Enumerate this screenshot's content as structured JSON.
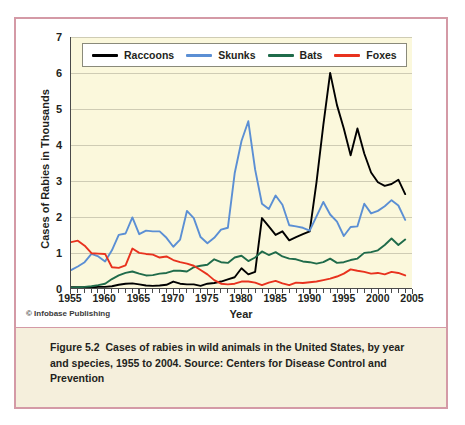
{
  "figure": {
    "credit": "© Infobase Publishing",
    "caption_label": "Figure 5.2",
    "caption_body": "Cases of rabies in wild animals in the United States, by year and species, 1955 to 2004. Source: Centers for Disease Control and Prevention"
  },
  "chart_data": {
    "type": "line",
    "title": "",
    "xlabel": "Year",
    "ylabel": "Cases of Rabies in Thousands",
    "xlim": [
      1955,
      2005
    ],
    "ylim": [
      0,
      7
    ],
    "xticks": [
      1955,
      1960,
      1965,
      1970,
      1975,
      1980,
      1985,
      1990,
      1995,
      2000,
      2005
    ],
    "yticks": [
      0,
      1,
      2,
      3,
      4,
      5,
      6,
      7
    ],
    "xtick_labels": [
      "1955",
      "1960",
      "1965",
      "1970",
      "1975",
      "1980",
      "1985",
      "1990",
      "1995",
      "2000",
      "2005"
    ],
    "ytick_labels": [
      "0",
      "1",
      "2",
      "3",
      "4",
      "5",
      "6",
      "7"
    ],
    "minor_xtick_interval": 1,
    "grid": "horizontal",
    "legend_position": "top-left",
    "x": [
      1955,
      1956,
      1957,
      1958,
      1959,
      1960,
      1961,
      1962,
      1963,
      1964,
      1965,
      1966,
      1967,
      1968,
      1969,
      1970,
      1971,
      1972,
      1973,
      1974,
      1975,
      1976,
      1977,
      1978,
      1979,
      1980,
      1981,
      1982,
      1983,
      1984,
      1985,
      1986,
      1987,
      1988,
      1989,
      1990,
      1991,
      1992,
      1993,
      1994,
      1995,
      1996,
      1997,
      1998,
      1999,
      2000,
      2001,
      2002,
      2003,
      2004
    ],
    "series": [
      {
        "name": "Raccoons",
        "color": "#000000",
        "values": [
          0.02,
          0.02,
          0.02,
          0.02,
          0.03,
          0.03,
          0.05,
          0.09,
          0.12,
          0.13,
          0.1,
          0.07,
          0.06,
          0.07,
          0.09,
          0.18,
          0.12,
          0.1,
          0.1,
          0.06,
          0.12,
          0.14,
          0.18,
          0.24,
          0.3,
          0.55,
          0.38,
          0.45,
          1.95,
          1.72,
          1.48,
          1.58,
          1.33,
          1.42,
          1.5,
          1.58,
          2.95,
          4.55,
          6.0,
          5.1,
          4.45,
          3.7,
          4.45,
          3.75,
          3.22,
          2.95,
          2.85,
          2.9,
          3.02,
          2.62
        ]
      },
      {
        "name": "Skunks",
        "color": "#5b8fd4",
        "values": [
          0.5,
          0.6,
          0.72,
          0.95,
          0.88,
          0.74,
          1.05,
          1.48,
          1.52,
          1.97,
          1.5,
          1.6,
          1.58,
          1.58,
          1.4,
          1.15,
          1.35,
          2.15,
          1.95,
          1.42,
          1.25,
          1.4,
          1.63,
          1.68,
          3.2,
          4.1,
          4.65,
          3.3,
          2.35,
          2.2,
          2.58,
          2.32,
          1.75,
          1.72,
          1.68,
          1.6,
          2.0,
          2.4,
          2.05,
          1.85,
          1.45,
          1.7,
          1.72,
          2.35,
          2.08,
          2.15,
          2.28,
          2.45,
          2.3,
          1.9
        ]
      },
      {
        "name": "Bats",
        "color": "#1f6b4a",
        "values": [
          0.01,
          0.02,
          0.03,
          0.05,
          0.08,
          0.12,
          0.25,
          0.35,
          0.42,
          0.46,
          0.4,
          0.35,
          0.36,
          0.4,
          0.42,
          0.48,
          0.48,
          0.46,
          0.58,
          0.62,
          0.65,
          0.8,
          0.72,
          0.7,
          0.85,
          0.9,
          0.75,
          0.85,
          1.02,
          0.92,
          1.0,
          0.88,
          0.82,
          0.8,
          0.74,
          0.72,
          0.68,
          0.72,
          0.82,
          0.7,
          0.72,
          0.78,
          0.82,
          0.98,
          1.0,
          1.05,
          1.2,
          1.38,
          1.2,
          1.35
        ]
      },
      {
        "name": "Foxes",
        "color": "#e8321e",
        "values": [
          1.28,
          1.32,
          1.18,
          0.97,
          0.96,
          0.95,
          0.58,
          0.56,
          0.63,
          1.1,
          0.98,
          0.95,
          0.93,
          0.85,
          0.88,
          0.78,
          0.72,
          0.68,
          0.62,
          0.5,
          0.38,
          0.22,
          0.12,
          0.1,
          0.12,
          0.18,
          0.18,
          0.15,
          0.08,
          0.15,
          0.2,
          0.13,
          0.08,
          0.15,
          0.14,
          0.16,
          0.18,
          0.22,
          0.26,
          0.32,
          0.4,
          0.52,
          0.48,
          0.45,
          0.4,
          0.42,
          0.38,
          0.45,
          0.42,
          0.35
        ]
      }
    ]
  }
}
